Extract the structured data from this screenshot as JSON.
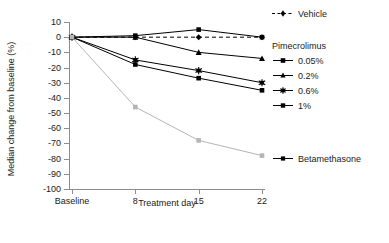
{
  "chart_data": {
    "type": "line",
    "title": "",
    "xlabel": "Treatment day",
    "ylabel": "Median change from baseline (%)",
    "categories": [
      "Baseline",
      "8",
      "15",
      "22"
    ],
    "x_tick_labels": [
      "Baseline",
      "8",
      "15",
      "22"
    ],
    "y_tick_labels": [
      "10",
      "0",
      "-10",
      "-20",
      "-30",
      "-40",
      "-50",
      "-60",
      "-70",
      "-80",
      "-90",
      "-100"
    ],
    "y_tick_values": [
      10,
      0,
      -10,
      -20,
      -30,
      -40,
      -50,
      -60,
      -70,
      -80,
      -90,
      -100
    ],
    "ylim": [
      -100,
      10
    ],
    "grid": false,
    "legend_position": "right",
    "series": [
      {
        "name": "Vehicle",
        "values": [
          0,
          0,
          0,
          0
        ],
        "color": "#000000",
        "dash": "4,3",
        "marker": "diamond"
      },
      {
        "name": "0.05%",
        "values": [
          0,
          1,
          5,
          0
        ],
        "color": "#000000",
        "dash": "none",
        "marker": "square"
      },
      {
        "name": "0.2%",
        "values": [
          0,
          0,
          -10,
          -14
        ],
        "color": "#000000",
        "dash": "none",
        "marker": "triangle"
      },
      {
        "name": "0.6%",
        "values": [
          0,
          -15,
          -22,
          -30
        ],
        "color": "#000000",
        "dash": "none",
        "marker": "star"
      },
      {
        "name": "1%",
        "values": [
          0,
          -18,
          -27,
          -35
        ],
        "color": "#000000",
        "dash": "none",
        "marker": "square"
      },
      {
        "name": "Betamethasone",
        "values": [
          0,
          -46,
          -68,
          -78
        ],
        "color": "#b5b5b5",
        "dash": "none",
        "marker": "square"
      }
    ]
  },
  "legend": {
    "vehicle_label": "Vehicle",
    "group_title": "Pimecrolimus",
    "dose_labels": [
      "0.05%",
      "0.2%",
      "0.6%",
      "1%"
    ],
    "betamethasone_label": "Betamethasone"
  },
  "axes": {
    "x_title": "Treatment day",
    "y_title": "Median change from baseline (%)"
  }
}
